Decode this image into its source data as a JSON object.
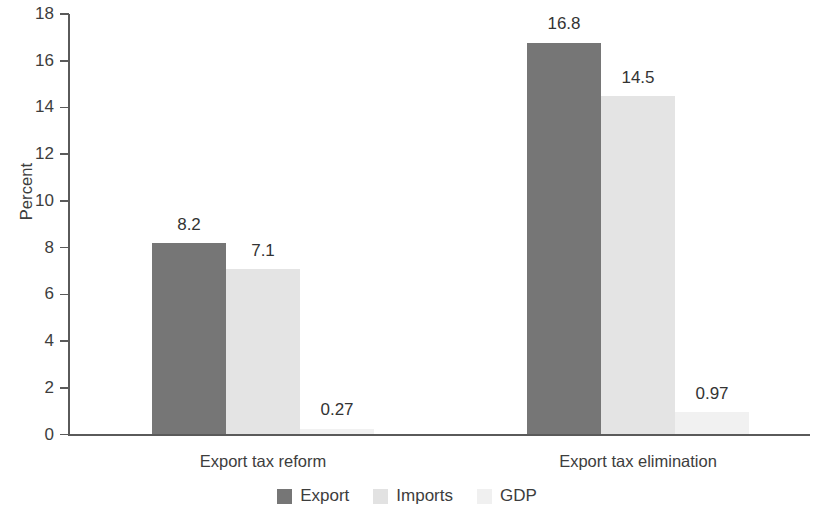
{
  "chart_data": {
    "type": "bar",
    "title": "",
    "subtitle": "",
    "xlabel": "",
    "ylabel": "Percent",
    "categories": [
      "Export tax reform",
      "Export tax elimination"
    ],
    "series": [
      {
        "name": "Export",
        "color": "#767676",
        "values": [
          8.2,
          16.8
        ],
        "labels": [
          "8.2",
          "16.8"
        ]
      },
      {
        "name": "Imports",
        "color": "#e4e4e4",
        "values": [
          7.1,
          14.5
        ],
        "labels": [
          "7.1",
          "14.5"
        ]
      },
      {
        "name": "GDP",
        "color": "#f1f1f1",
        "values": [
          0.27,
          0.97
        ],
        "labels": [
          "0.27",
          "0.97"
        ]
      }
    ],
    "ylim": [
      0,
      18
    ],
    "ytick_step": 2,
    "ytick_labels": [
      "18",
      "16",
      "14",
      "12",
      "10",
      "8",
      "6",
      "4",
      "2",
      "0"
    ],
    "grid": false,
    "legend_position": "bottom-center",
    "value_labels_shown": true,
    "background_color": "#ffffff",
    "axis_color": "#5a5a5a"
  }
}
